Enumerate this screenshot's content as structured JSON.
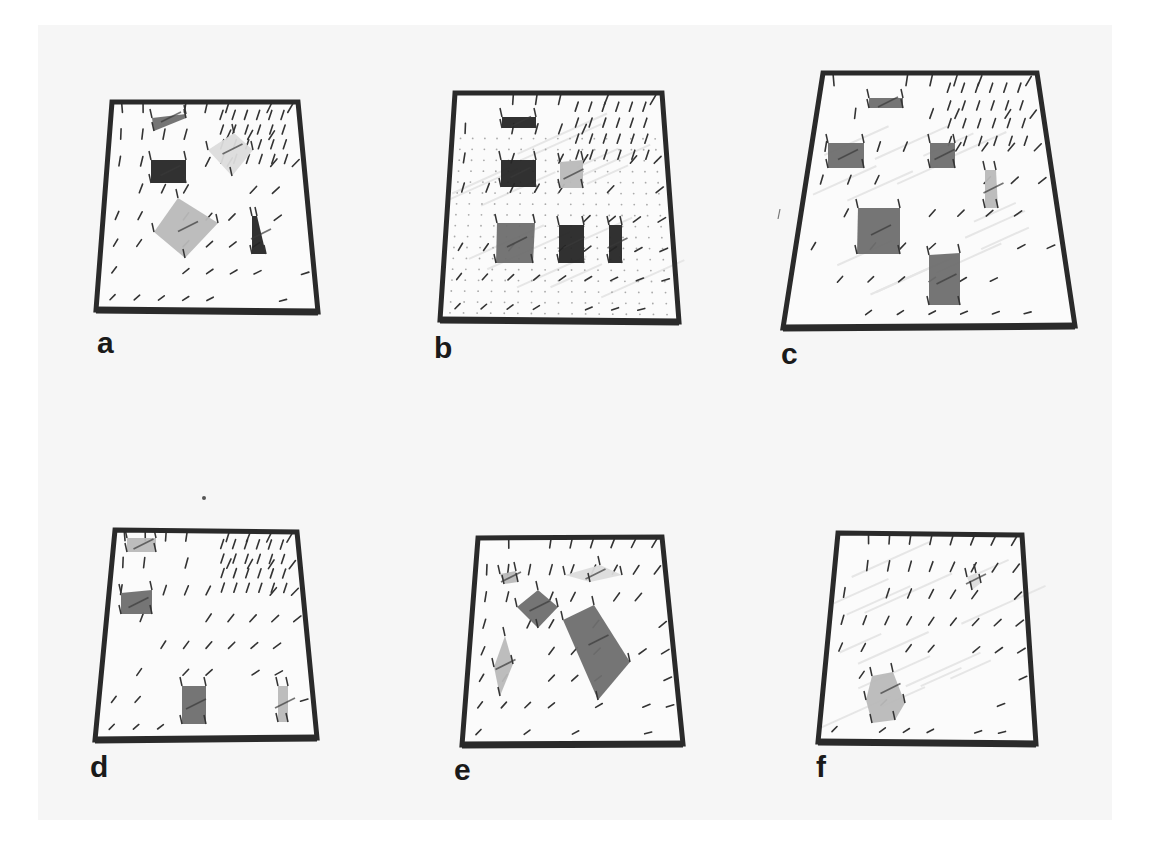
{
  "figure": {
    "colors": {
      "page": "#f6f6f6",
      "frame": "#2a2a2a",
      "plane": "#fbfbfb",
      "needle": "#333333",
      "patch_dark": "#262626",
      "patch_mid": "#6e6e6e",
      "patch_light": "#b9b9b9",
      "patch_faint": "#dcdcdc"
    },
    "panels": [
      {
        "label": "a",
        "frame": [
          [
            112,
            102
          ],
          [
            298,
            102
          ],
          [
            318,
            312
          ],
          [
            96,
            310
          ]
        ],
        "label_pos": [
          97,
          328
        ],
        "patches": [
          {
            "shape": "quad",
            "pts": [
              [
                152,
                118
              ],
              [
                186,
                114
              ],
              [
                186,
                118
              ],
              [
                154,
                131
              ]
            ],
            "tone": "mid"
          },
          {
            "shape": "quad",
            "pts": [
              [
                151,
                160
              ],
              [
                186,
                160
              ],
              [
                186,
                183
              ],
              [
                151,
                183
              ]
            ],
            "tone": "dark"
          },
          {
            "shape": "quad",
            "pts": [
              [
                208,
                150
              ],
              [
                234,
                133
              ],
              [
                253,
                150
              ],
              [
                232,
                176
              ]
            ],
            "tone": "faint"
          },
          {
            "shape": "quad",
            "pts": [
              [
                154,
                232
              ],
              [
                178,
                198
              ],
              [
                218,
                223
              ],
              [
                185,
                258
              ]
            ],
            "tone": "light"
          },
          {
            "shape": "quad",
            "pts": [
              [
                252,
                216
              ],
              [
                257,
                216
              ],
              [
                266,
                254
              ],
              [
                252,
                254
              ]
            ],
            "tone": "dark"
          }
        ]
      },
      {
        "label": "b",
        "frame": [
          [
            455,
            93
          ],
          [
            662,
            93
          ],
          [
            679,
            322
          ],
          [
            440,
            320
          ]
        ],
        "label_pos": [
          434,
          340
        ],
        "patches": [
          {
            "shape": "quad",
            "pts": [
              [
                502,
                117
              ],
              [
                536,
                117
              ],
              [
                536,
                128
              ],
              [
                502,
                128
              ]
            ],
            "tone": "dark"
          },
          {
            "shape": "quad",
            "pts": [
              [
                501,
                160
              ],
              [
                536,
                160
              ],
              [
                536,
                187
              ],
              [
                501,
                187
              ]
            ],
            "tone": "dark"
          },
          {
            "shape": "quad",
            "pts": [
              [
                560,
                162
              ],
              [
                583,
                160
              ],
              [
                583,
                188
              ],
              [
                560,
                188
              ]
            ],
            "tone": "light"
          },
          {
            "shape": "quad",
            "pts": [
              [
                497,
                223
              ],
              [
                535,
                223
              ],
              [
                533,
                263
              ],
              [
                496,
                263
              ]
            ],
            "tone": "mid"
          },
          {
            "shape": "quad",
            "pts": [
              [
                559,
                225
              ],
              [
                584,
                225
              ],
              [
                584,
                263
              ],
              [
                559,
                263
              ]
            ],
            "tone": "dark"
          },
          {
            "shape": "quad",
            "pts": [
              [
                609,
                225
              ],
              [
                622,
                225
              ],
              [
                622,
                263
              ],
              [
                609,
                263
              ]
            ],
            "tone": "dark"
          }
        ]
      },
      {
        "label": "c",
        "frame": [
          [
            823,
            73
          ],
          [
            1037,
            73
          ],
          [
            1075,
            326
          ],
          [
            783,
            328
          ]
        ],
        "label_pos": [
          781,
          346
        ],
        "patches": [
          {
            "shape": "quad",
            "pts": [
              [
                869,
                98
              ],
              [
                903,
                98
              ],
              [
                903,
                108
              ],
              [
                869,
                108
              ]
            ],
            "tone": "mid"
          },
          {
            "shape": "quad",
            "pts": [
              [
                828,
                143
              ],
              [
                864,
                143
              ],
              [
                864,
                168
              ],
              [
                828,
                168
              ]
            ],
            "tone": "mid"
          },
          {
            "shape": "quad",
            "pts": [
              [
                930,
                143
              ],
              [
                955,
                143
              ],
              [
                955,
                168
              ],
              [
                930,
                168
              ]
            ],
            "tone": "mid"
          },
          {
            "shape": "quad",
            "pts": [
              [
                985,
                170
              ],
              [
                996,
                170
              ],
              [
                998,
                208
              ],
              [
                985,
                208
              ]
            ],
            "tone": "light"
          },
          {
            "shape": "quad",
            "pts": [
              [
                858,
                208
              ],
              [
                900,
                208
              ],
              [
                900,
                254
              ],
              [
                857,
                254
              ]
            ],
            "tone": "mid"
          },
          {
            "shape": "quad",
            "pts": [
              [
                929,
                255
              ],
              [
                960,
                253
              ],
              [
                960,
                305
              ],
              [
                929,
                305
              ]
            ],
            "tone": "mid"
          }
        ]
      },
      {
        "label": "d",
        "frame": [
          [
            115,
            530
          ],
          [
            297,
            532
          ],
          [
            317,
            738
          ],
          [
            95,
            740
          ]
        ],
        "label_pos": [
          90,
          758
        ],
        "patches": [
          {
            "shape": "quad",
            "pts": [
              [
                127,
                538
              ],
              [
                156,
                538
              ],
              [
                156,
                552
              ],
              [
                127,
                552
              ]
            ],
            "tone": "light"
          },
          {
            "shape": "quad",
            "pts": [
              [
                121,
                593
              ],
              [
                152,
                590
              ],
              [
                152,
                614
              ],
              [
                121,
                614
              ]
            ],
            "tone": "mid"
          },
          {
            "shape": "quad",
            "pts": [
              [
                182,
                686
              ],
              [
                206,
                686
              ],
              [
                206,
                724
              ],
              [
                182,
                724
              ]
            ],
            "tone": "mid"
          },
          {
            "shape": "quad",
            "pts": [
              [
                278,
                686
              ],
              [
                288,
                686
              ],
              [
                288,
                722
              ],
              [
                278,
                722
              ]
            ],
            "tone": "light"
          }
        ]
      },
      {
        "label": "e",
        "frame": [
          [
            478,
            538
          ],
          [
            662,
            537
          ],
          [
            683,
            744
          ],
          [
            462,
            745
          ]
        ],
        "label_pos": [
          454,
          762
        ],
        "patches": [
          {
            "shape": "quad",
            "pts": [
              [
                500,
                574
              ],
              [
                516,
                571
              ],
              [
                518,
                582
              ],
              [
                504,
                584
              ]
            ],
            "tone": "light"
          },
          {
            "shape": "quad",
            "pts": [
              [
                517,
                607
              ],
              [
                538,
                590
              ],
              [
                558,
                607
              ],
              [
                538,
                628
              ]
            ],
            "tone": "mid"
          },
          {
            "shape": "quad",
            "pts": [
              [
                563,
                620
              ],
              [
                594,
                605
              ],
              [
                630,
                662
              ],
              [
                598,
                700
              ]
            ],
            "tone": "mid"
          },
          {
            "shape": "quad",
            "pts": [
              [
                494,
                667
              ],
              [
                505,
                636
              ],
              [
                513,
                664
              ],
              [
                500,
                696
              ]
            ],
            "tone": "light"
          },
          {
            "shape": "quad",
            "pts": [
              [
                565,
                575
              ],
              [
                600,
                565
              ],
              [
                622,
                575
              ],
              [
                590,
                582
              ]
            ],
            "tone": "faint"
          }
        ]
      },
      {
        "label": "f",
        "frame": [
          [
            838,
            533
          ],
          [
            1022,
            535
          ],
          [
            1036,
            744
          ],
          [
            818,
            742
          ]
        ],
        "label_pos": [
          816,
          760
        ],
        "patches": [
          {
            "shape": "hex",
            "pts": [
              [
                872,
                676
              ],
              [
                893,
                672
              ],
              [
                905,
                703
              ],
              [
                895,
                720
              ],
              [
                872,
                723
              ],
              [
                866,
                700
              ]
            ],
            "tone": "light"
          },
          {
            "shape": "quad",
            "pts": [
              [
                967,
                577
              ],
              [
                976,
                573
              ],
              [
                981,
                583
              ],
              [
                972,
                590
              ]
            ],
            "tone": "faint"
          }
        ]
      }
    ],
    "stray_marks": [
      {
        "type": "dot",
        "pos": [
          204,
          498
        ]
      },
      {
        "type": "tick",
        "pos": [
          779,
          214
        ]
      }
    ]
  }
}
